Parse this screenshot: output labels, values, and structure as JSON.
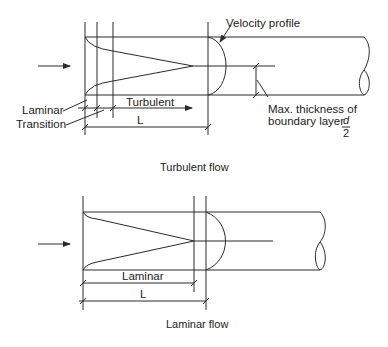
{
  "turbulent_diagram": {
    "caption": "Turbulent flow",
    "labels": {
      "velocity_profile": "Velocity profile",
      "laminar": "Laminar",
      "transition": "Transition",
      "turbulent": "Turbulent",
      "length": "L",
      "max_thickness_line1": "Max. thickness of",
      "max_thickness_line2": "boundary layer",
      "fraction_numerator": "d",
      "fraction_denominator": "2"
    }
  },
  "laminar_diagram": {
    "caption": "Laminar flow",
    "labels": {
      "laminar": "Laminar",
      "length": "L"
    }
  }
}
